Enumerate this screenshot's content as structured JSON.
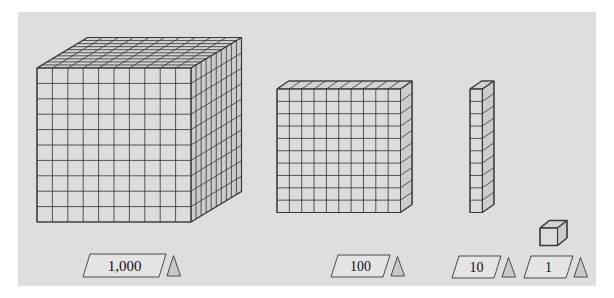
{
  "figure": {
    "background_color": "#dedede",
    "page_color": "#ffffff",
    "line_color": "#3a3a3a",
    "face_front_color": "#dcdcdc",
    "face_top_color": "#d2d2d2",
    "face_side_color": "#cccccc",
    "label_fill_color": "#e4e4e4",
    "text_color": "#111111"
  },
  "blocks": [
    {
      "id": "thousand-cube",
      "label": "1,000",
      "value": 1000,
      "shape": "cube",
      "units_wide": 10,
      "units_tall": 10,
      "units_deep": 10,
      "label_x": 83,
      "label_y": 254,
      "label_w": 97,
      "label_h": 23,
      "font_size": 15
    },
    {
      "id": "hundred-flat",
      "label": "100",
      "value": 100,
      "shape": "flat",
      "units_wide": 10,
      "units_tall": 10,
      "units_deep": 1,
      "label_x": 331,
      "label_y": 255,
      "label_w": 73,
      "label_h": 22,
      "font_size": 14
    },
    {
      "id": "ten-rod",
      "label": "10",
      "value": 10,
      "shape": "rod",
      "units_wide": 1,
      "units_tall": 10,
      "units_deep": 1,
      "label_x": 452,
      "label_y": 256,
      "label_w": 63,
      "label_h": 22,
      "font_size": 14
    },
    {
      "id": "one-unit",
      "label": "1",
      "value": 1,
      "shape": "unit",
      "units_wide": 1,
      "units_tall": 1,
      "units_deep": 1,
      "label_x": 524,
      "label_y": 256,
      "label_w": 63,
      "label_h": 22,
      "font_size": 14
    }
  ],
  "legend": {
    "marker_icon": "triangle-icon",
    "marker_count": 4
  }
}
